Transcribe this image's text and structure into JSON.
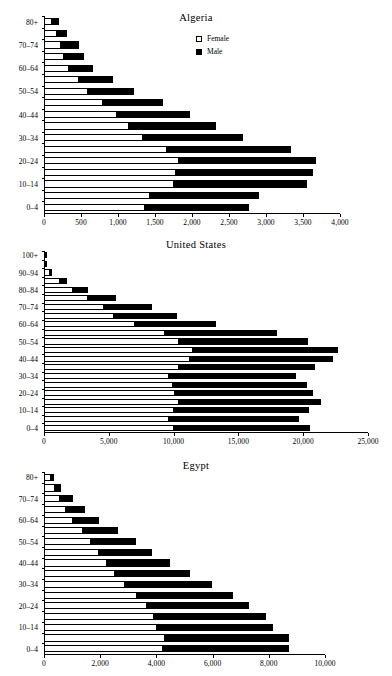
{
  "legend": {
    "female_label": "Female",
    "male_label": "Male",
    "female_swatch": "white-square-icon",
    "male_swatch": "black-square-icon"
  },
  "chart_data": [
    {
      "type": "bar",
      "orientation": "horizontal",
      "stacked": true,
      "title": "Algeria",
      "xlabel": "",
      "ylabel": "",
      "xlim": [
        0,
        4000
      ],
      "xticks": [
        0,
        500,
        1000,
        1500,
        2000,
        2500,
        3000,
        3500,
        4000
      ],
      "xticklabels": [
        "0",
        "500",
        "1,000",
        "1,500",
        "2,000",
        "2,500",
        "3,000",
        "3,500",
        "4,000"
      ],
      "grid": false,
      "legend_position": "upper-center",
      "categories": [
        "0–4",
        "5–9",
        "10–14",
        "15–19",
        "20–24",
        "25–29",
        "30–34",
        "35–39",
        "40–44",
        "45–49",
        "50–54",
        "55–59",
        "60–64",
        "65–69",
        "70–74",
        "75–79",
        "80+"
      ],
      "visible_categories": [
        "0–4",
        "10–14",
        "20–24",
        "30–34",
        "40–44",
        "50–54",
        "60–64",
        "70–74",
        "80+"
      ],
      "series": [
        {
          "name": "Female",
          "values": [
            1360,
            1430,
            1760,
            1790,
            1820,
            1660,
            1340,
            1150,
            990,
            800,
            600,
            470,
            340,
            270,
            230,
            170,
            110
          ]
        },
        {
          "name": "Male",
          "values": [
            1420,
            1490,
            1810,
            1850,
            1870,
            1690,
            1360,
            1180,
            1000,
            820,
            630,
            480,
            330,
            280,
            250,
            150,
            110
          ]
        }
      ],
      "totals": [
        2780,
        2920,
        3570,
        3640,
        3690,
        3350,
        2700,
        2330,
        1990,
        1620,
        1230,
        950,
        670,
        550,
        480,
        320,
        220
      ]
    },
    {
      "type": "bar",
      "orientation": "horizontal",
      "stacked": true,
      "title": "United States",
      "xlabel": "",
      "ylabel": "",
      "xlim": [
        0,
        25000
      ],
      "xticks": [
        0,
        5000,
        10000,
        15000,
        20000,
        25000
      ],
      "xticklabels": [
        "0",
        "5,000",
        "10,000",
        "15,000",
        "20,000",
        "25,000"
      ],
      "grid": false,
      "legend_position": "none",
      "categories": [
        "0–4",
        "5–9",
        "10–14",
        "15–19",
        "20–24",
        "25–29",
        "30–34",
        "35–39",
        "40–44",
        "45–49",
        "50–54",
        "55–59",
        "60–64",
        "65–69",
        "70–74",
        "75–79",
        "80–84",
        "85–89",
        "90–94",
        "95–99",
        "100+"
      ],
      "visible_categories": [
        "0–4",
        "10–14",
        "20–24",
        "30–34",
        "40–44",
        "50–54",
        "60–64",
        "70–74",
        "80–84",
        "90–94",
        "100+"
      ],
      "series": [
        {
          "name": "Female",
          "values": [
            10030,
            9620,
            10050,
            10420,
            10120,
            9980,
            9650,
            10380,
            11240,
            11480,
            10380,
            9340,
            7020,
            5430,
            4620,
            3400,
            2220,
            1220,
            480,
            120,
            30
          ]
        },
        {
          "name": "Male",
          "values": [
            10560,
            10100,
            10450,
            10980,
            10700,
            10340,
            9830,
            10580,
            11100,
            11230,
            10020,
            8710,
            6340,
            4860,
            3780,
            2180,
            1260,
            580,
            200,
            40,
            10
          ]
        }
      ],
      "totals": [
        20590,
        19720,
        20500,
        21400,
        20820,
        20320,
        19480,
        20960,
        22340,
        22710,
        20400,
        18050,
        13360,
        10290,
        8400,
        5580,
        3480,
        1800,
        680,
        160,
        40
      ]
    },
    {
      "type": "bar",
      "orientation": "horizontal",
      "stacked": true,
      "title": "Egypt",
      "xlabel": "",
      "ylabel": "",
      "xlim": [
        0,
        10000
      ],
      "xticks": [
        0,
        2000,
        4000,
        6000,
        8000,
        10000
      ],
      "xticklabels": [
        "0",
        "2,000",
        "4,000",
        "6,000",
        "8,000",
        "10,000"
      ],
      "grid": false,
      "legend_position": "none",
      "categories": [
        "0–4",
        "5–9",
        "10–14",
        "15–19",
        "20–24",
        "25–29",
        "30–34",
        "35–39",
        "40–44",
        "45–49",
        "50–54",
        "55–59",
        "60–64",
        "65–69",
        "70–74",
        "75–79",
        "80+"
      ],
      "visible_categories": [
        "0–4",
        "10–14",
        "20–24",
        "30–34",
        "40–44",
        "50–54",
        "60–64",
        "70–74",
        "80+"
      ],
      "series": [
        {
          "name": "Female",
          "values": [
            4250,
            4300,
            4020,
            3900,
            3660,
            3320,
            2880,
            2530,
            2250,
            1970,
            1670,
            1380,
            1040,
            800,
            580,
            400,
            260
          ]
        },
        {
          "name": "Male",
          "values": [
            4500,
            4450,
            4170,
            4020,
            3660,
            3420,
            3120,
            2700,
            2250,
            1920,
            1630,
            1300,
            960,
            680,
            470,
            230,
            120
          ]
        }
      ],
      "totals": [
        8750,
        8750,
        8190,
        7920,
        7320,
        6740,
        6000,
        5230,
        4500,
        3890,
        3300,
        2680,
        2000,
        1480,
        1050,
        630,
        380
      ]
    }
  ]
}
